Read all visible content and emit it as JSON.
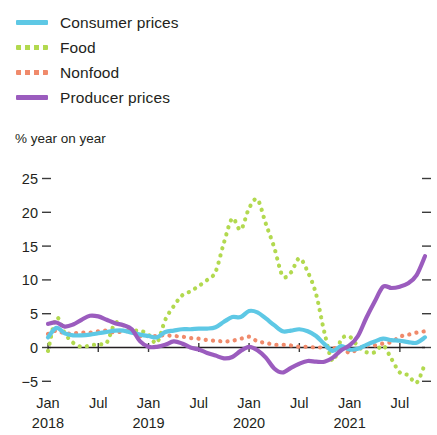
{
  "legend": {
    "items": [
      {
        "label": "Consumer prices",
        "color": "#5ec8e5",
        "style": "solid",
        "icon": "line-swatch-icon"
      },
      {
        "label": "Food",
        "color": "#b2d94f",
        "style": "dotted",
        "icon": "dotted-line-swatch-icon"
      },
      {
        "label": "Nonfood",
        "color": "#f08a6b",
        "style": "dotted",
        "icon": "dotted-line-swatch-icon"
      },
      {
        "label": "Producer prices",
        "color": "#9b5cbe",
        "style": "solid",
        "icon": "line-swatch-icon"
      }
    ]
  },
  "axis_unit": "% year on year",
  "chart_data": {
    "type": "line",
    "title": "",
    "subtitle": "% year on year",
    "xlabel": "",
    "ylabel": "% year on year",
    "ylim": [
      -7,
      25
    ],
    "yticks": [
      25,
      20,
      15,
      10,
      5,
      0,
      -5
    ],
    "ytick_labels": [
      "25",
      "20",
      "15",
      "10",
      "5",
      "0",
      "−5"
    ],
    "grid": false,
    "zero_line": true,
    "legend_position": "top-left",
    "xtick_months": [
      "Jan",
      "Jul",
      "Jan",
      "Jul",
      "Jan",
      "Jul",
      "Jan",
      "Jul"
    ],
    "xtick_years": [
      "2018",
      "",
      "2019",
      "",
      "2020",
      "",
      "2021",
      ""
    ],
    "x_start": "2018-01",
    "x_end": "2021-10",
    "x": [
      "2018-01",
      "2018-02",
      "2018-03",
      "2018-04",
      "2018-05",
      "2018-06",
      "2018-07",
      "2018-08",
      "2018-09",
      "2018-10",
      "2018-11",
      "2018-12",
      "2019-01",
      "2019-02",
      "2019-03",
      "2019-04",
      "2019-05",
      "2019-06",
      "2019-07",
      "2019-08",
      "2019-09",
      "2019-10",
      "2019-11",
      "2019-12",
      "2020-01",
      "2020-02",
      "2020-03",
      "2020-04",
      "2020-05",
      "2020-06",
      "2020-07",
      "2020-08",
      "2020-09",
      "2020-10",
      "2020-11",
      "2020-12",
      "2021-01",
      "2021-02",
      "2021-03",
      "2021-04",
      "2021-05",
      "2021-06",
      "2021-07",
      "2021-08",
      "2021-09",
      "2021-10"
    ],
    "series": [
      {
        "name": "Consumer prices",
        "color": "#5ec8e5",
        "style": "solid",
        "values": [
          1.5,
          2.9,
          2.1,
          1.8,
          1.8,
          1.9,
          2.1,
          2.3,
          2.5,
          2.5,
          2.2,
          1.9,
          1.7,
          1.5,
          2.3,
          2.5,
          2.7,
          2.7,
          2.8,
          2.8,
          3.0,
          3.8,
          4.5,
          4.5,
          5.4,
          5.2,
          4.3,
          3.3,
          2.4,
          2.5,
          2.7,
          2.4,
          1.7,
          0.5,
          -0.5,
          0.2,
          -0.3,
          -0.2,
          0.4,
          0.9,
          1.3,
          1.1,
          1.0,
          0.8,
          0.7,
          1.5
        ]
      },
      {
        "name": "Food",
        "color": "#b2d94f",
        "style": "dotted",
        "values": [
          -0.5,
          4.4,
          2.1,
          0.7,
          0.1,
          0.3,
          0.5,
          0.7,
          3.6,
          3.3,
          2.5,
          2.5,
          1.9,
          0.7,
          4.1,
          6.1,
          7.7,
          8.3,
          9.1,
          10.0,
          11.2,
          15.5,
          19.1,
          17.4,
          20.6,
          21.9,
          18.3,
          14.8,
          10.6,
          11.1,
          13.2,
          11.2,
          7.9,
          2.2,
          -2.0,
          1.2,
          1.6,
          0.2,
          -0.7,
          -0.7,
          0.3,
          -1.7,
          -3.7,
          -4.1,
          -5.2,
          -2.4
        ]
      },
      {
        "name": "Nonfood",
        "color": "#f08a6b",
        "style": "dotted",
        "values": [
          2.0,
          2.5,
          2.1,
          2.1,
          2.2,
          2.2,
          2.4,
          2.5,
          2.2,
          2.4,
          2.3,
          1.7,
          1.7,
          1.7,
          1.8,
          1.7,
          1.6,
          1.4,
          1.3,
          1.1,
          1.0,
          0.9,
          1.0,
          1.3,
          1.6,
          0.9,
          0.7,
          0.4,
          0.4,
          0.3,
          0.1,
          0.1,
          0.0,
          0.0,
          -0.1,
          0.0,
          -0.8,
          -0.2,
          0.3,
          0.3,
          0.6,
          0.8,
          1.6,
          1.9,
          2.2,
          2.4
        ]
      },
      {
        "name": "Producer prices",
        "color": "#9b5cbe",
        "style": "solid",
        "values": [
          3.5,
          3.7,
          3.1,
          3.4,
          4.1,
          4.7,
          4.6,
          4.1,
          3.6,
          3.3,
          2.7,
          0.9,
          0.1,
          0.1,
          0.4,
          0.9,
          0.6,
          0.0,
          -0.3,
          -0.8,
          -1.2,
          -1.6,
          -1.4,
          -0.5,
          0.1,
          -0.4,
          -1.5,
          -3.1,
          -3.7,
          -3.0,
          -2.4,
          -2.0,
          -2.1,
          -2.1,
          -1.5,
          -0.4,
          0.3,
          1.7,
          4.4,
          6.8,
          9.0,
          8.8,
          9.0,
          9.5,
          10.7,
          13.5
        ]
      }
    ]
  }
}
